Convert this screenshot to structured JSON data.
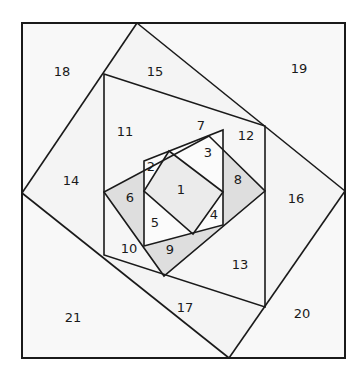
{
  "diagram": {
    "colors": {
      "line": "#1a1a1a",
      "light_fill": "#f7f7f7",
      "white_fill": "#ffffff",
      "shaded_fill": "#dedede",
      "center_fill": "#ebebeb"
    },
    "pieces": [
      {
        "id": "1",
        "label": "1",
        "x": 181,
        "y": 190,
        "shade": "center"
      },
      {
        "id": "2",
        "label": "2",
        "x": 151,
        "y": 167,
        "shade": "white"
      },
      {
        "id": "3",
        "label": "3",
        "x": 208,
        "y": 153,
        "shade": "white"
      },
      {
        "id": "4",
        "label": "4",
        "x": 214,
        "y": 215,
        "shade": "white"
      },
      {
        "id": "5",
        "label": "5",
        "x": 155,
        "y": 223,
        "shade": "white"
      },
      {
        "id": "6",
        "label": "6",
        "x": 130,
        "y": 198,
        "shade": "shaded"
      },
      {
        "id": "7",
        "label": "7",
        "x": 201,
        "y": 126,
        "shade": "shaded"
      },
      {
        "id": "8",
        "label": "8",
        "x": 238,
        "y": 180,
        "shade": "shaded"
      },
      {
        "id": "9",
        "label": "9",
        "x": 170,
        "y": 250,
        "shade": "shaded"
      },
      {
        "id": "10",
        "label": "10",
        "x": 129,
        "y": 249,
        "shade": "light"
      },
      {
        "id": "11",
        "label": "11",
        "x": 125,
        "y": 132,
        "shade": "light"
      },
      {
        "id": "12",
        "label": "12",
        "x": 246,
        "y": 136,
        "shade": "light"
      },
      {
        "id": "13",
        "label": "13",
        "x": 240,
        "y": 265,
        "shade": "light"
      },
      {
        "id": "14",
        "label": "14",
        "x": 71,
        "y": 181,
        "shade": "light"
      },
      {
        "id": "15",
        "label": "15",
        "x": 155,
        "y": 72,
        "shade": "light"
      },
      {
        "id": "16",
        "label": "16",
        "x": 296,
        "y": 199,
        "shade": "light"
      },
      {
        "id": "17",
        "label": "17",
        "x": 185,
        "y": 308,
        "shade": "light"
      },
      {
        "id": "18",
        "label": "18",
        "x": 62,
        "y": 72,
        "shade": "light"
      },
      {
        "id": "19",
        "label": "19",
        "x": 299,
        "y": 69,
        "shade": "light"
      },
      {
        "id": "20",
        "label": "20",
        "x": 302,
        "y": 314,
        "shade": "light"
      },
      {
        "id": "21",
        "label": "21",
        "x": 73,
        "y": 318,
        "shade": "light"
      }
    ]
  }
}
